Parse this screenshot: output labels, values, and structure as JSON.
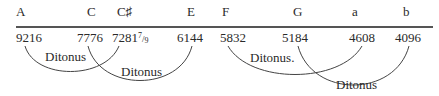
{
  "diagram": {
    "notes": [
      {
        "name": "A",
        "x": 16
      },
      {
        "name": "C",
        "x": 87
      },
      {
        "name": "C♯",
        "x": 117
      },
      {
        "name": "E",
        "x": 187
      },
      {
        "name": "F",
        "x": 222
      },
      {
        "name": "G",
        "x": 293
      },
      {
        "name": "a",
        "x": 352
      },
      {
        "name": "b",
        "x": 403
      }
    ],
    "values": [
      {
        "value": "9216",
        "x": 16
      },
      {
        "value": "7776",
        "x": 77
      },
      {
        "value": "7281",
        "frac_num": "7",
        "frac_den": "9",
        "x": 112
      },
      {
        "value": "6144",
        "x": 177
      },
      {
        "value": "5832",
        "x": 220
      },
      {
        "value": "5184",
        "x": 282
      },
      {
        "value": "4608",
        "x": 349
      },
      {
        "value": "4096",
        "x": 395
      }
    ],
    "intervals": [
      {
        "label": "Ditonus",
        "from": "9216",
        "to": "7281 7/9",
        "label_x": 45,
        "label_y": 50
      },
      {
        "label": "Ditonus",
        "from": "7776",
        "to": "6144",
        "label_x": 121,
        "label_y": 65
      },
      {
        "label": "Ditonus.",
        "from": "5832",
        "to": "4608",
        "label_x": 250,
        "label_y": 51
      },
      {
        "label": "Ditonus",
        "from": "5184",
        "to": "4096",
        "label_x": 336,
        "label_y": 78
      }
    ],
    "line_color": "#444444"
  }
}
